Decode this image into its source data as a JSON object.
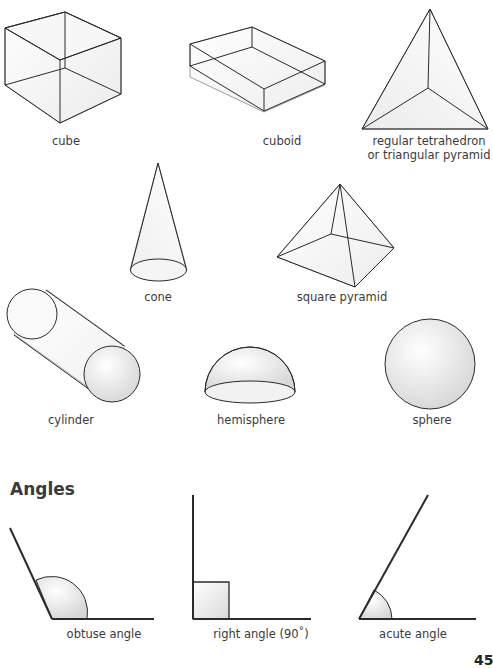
{
  "shapes": [
    {
      "id": "cube",
      "label": "cube"
    },
    {
      "id": "cuboid",
      "label": "cuboid"
    },
    {
      "id": "tetrahedron",
      "label_line1": "regular tetrahedron",
      "label_line2": "or triangular pyramid"
    },
    {
      "id": "cone",
      "label": "cone"
    },
    {
      "id": "square-pyramid",
      "label": "square pyramid"
    },
    {
      "id": "cylinder",
      "label": "cylinder"
    },
    {
      "id": "hemisphere",
      "label": "hemisphere"
    },
    {
      "id": "sphere",
      "label": "sphere"
    }
  ],
  "angles": {
    "heading": "Angles",
    "items": [
      {
        "id": "obtuse",
        "label": "obtuse angle"
      },
      {
        "id": "right",
        "label": "right angle (90˚)"
      },
      {
        "id": "acute",
        "label": "acute angle"
      }
    ]
  },
  "page": {
    "number": "45"
  },
  "colors": {
    "line": "#2a2a2a",
    "fill_light": "#f3f3f3",
    "fill_mid": "#d8d8d8"
  }
}
